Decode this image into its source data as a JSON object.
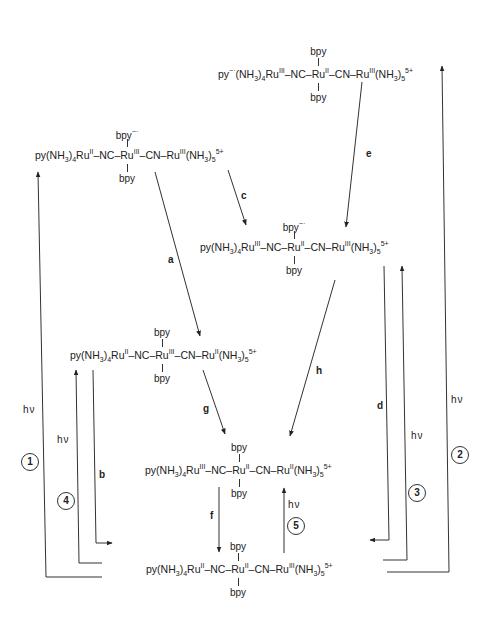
{
  "diagram": {
    "type": "photoinduced electron transfer scheme",
    "species": [
      {
        "id": "top",
        "left": "py⁻·(NH3)4Ru(III)",
        "bridge1": "NC",
        "center": "Ru(II)",
        "bridge2": "CN",
        "right": "Ru(III)(NH3)5",
        "charge": "5+",
        "top_ligand": "bpy",
        "bottom_ligand": "bpy"
      },
      {
        "id": "upper-left",
        "left": "py(NH3)4Ru(II)",
        "bridge1": "NC",
        "center": "Ru(III)",
        "bridge2": "CN",
        "right": "Ru(III)(NH3)5",
        "charge": "5+",
        "top_ligand": "bpy⁻·",
        "bottom_ligand": "bpy"
      },
      {
        "id": "upper-right",
        "left": "py(NH3)4Ru(III)",
        "bridge1": "NC",
        "center": "Ru(II)",
        "bridge2": "CN",
        "right": "Ru(III)(NH3)5",
        "charge": "5+",
        "top_ligand": "bpy⁻·",
        "bottom_ligand": "bpy"
      },
      {
        "id": "middle-left",
        "left": "py(NH3)4Ru(II)",
        "bridge1": "NC",
        "center": "Ru(III)",
        "bridge2": "CN",
        "right": "Ru(II)(NH3)5",
        "charge": "5+",
        "top_ligand": "bpy",
        "bottom_ligand": "bpy"
      },
      {
        "id": "lower",
        "left": "py(NH3)4Ru(III)",
        "bridge1": "NC",
        "center": "Ru(II)",
        "bridge2": "CN",
        "right": "Ru(II)(NH3)5",
        "charge": "5+",
        "top_ligand": "bpy",
        "bottom_ligand": "bpy"
      },
      {
        "id": "ground",
        "left": "py(NH3)4Ru(II)",
        "bridge1": "NC",
        "center": "Ru(II)",
        "bridge2": "CN",
        "right": "Ru(III)(NH3)5",
        "charge": "5+",
        "top_ligand": "bpy",
        "bottom_ligand": "bpy"
      }
    ],
    "step_labels": [
      "a",
      "b",
      "c",
      "d",
      "e",
      "f",
      "g",
      "h"
    ],
    "photo_labels": [
      "hν",
      "hν",
      "hν",
      "hν",
      "hν"
    ],
    "circled": [
      "1",
      "2",
      "3",
      "4",
      "5"
    ]
  },
  "text": {
    "py": "py",
    "py_rad": "py",
    "rad": "−·",
    "nh3": "(NH",
    "three": "3",
    "four": "4",
    "five": "5",
    "close": ")",
    "ru": "Ru",
    "II": "II",
    "III": "III",
    "nc": "–NC–",
    "cn": "–CN–",
    "charge": "5+",
    "bpy": "bpy",
    "bpyrad": "bpy",
    "hv": "hν"
  }
}
